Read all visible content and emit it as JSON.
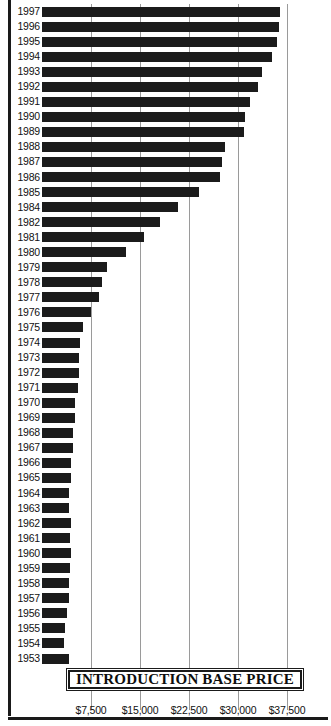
{
  "chart_data": {
    "type": "bar",
    "orientation": "horizontal",
    "title": "INTRODUCTION BASE PRICE",
    "xlabel": "",
    "ylabel": "",
    "xlim": [
      0,
      38700
    ],
    "grid": true,
    "gridlines_at": [
      7500,
      15000,
      22500,
      30000,
      37500
    ],
    "xtick_labels": [
      "$7,500",
      "$15,000",
      "$22,500",
      "$30,000",
      "$37,500"
    ],
    "xtick_values": [
      7500,
      15000,
      22500,
      30000,
      37500
    ],
    "legend": "none",
    "categories": [
      "1997",
      "1996",
      "1995",
      "1994",
      "1993",
      "1992",
      "1991",
      "1990",
      "1989",
      "1988",
      "1987",
      "1986",
      "1985",
      "1984",
      "1982",
      "1981",
      "1980",
      "1979",
      "1978",
      "1977",
      "1976",
      "1975",
      "1974",
      "1973",
      "1972",
      "1971",
      "1970",
      "1969",
      "1968",
      "1967",
      "1966",
      "1965",
      "1964",
      "1963",
      "1962",
      "1961",
      "1960",
      "1959",
      "1958",
      "1957",
      "1956",
      "1955",
      "1954",
      "1953"
    ],
    "values": [
      36500,
      36200,
      36000,
      35200,
      33700,
      33100,
      31900,
      31100,
      30900,
      28000,
      27600,
      27200,
      24000,
      20800,
      18000,
      15600,
      12800,
      9900,
      9200,
      8700,
      7500,
      6300,
      5800,
      5600,
      5700,
      5500,
      5100,
      5000,
      4800,
      4700,
      4500,
      4400,
      4100,
      4200,
      4400,
      4300,
      4400,
      4300,
      4200,
      4100,
      3900,
      3500,
      3400,
      4200
    ]
  },
  "axis": {
    "tick_label_0": "$7,500",
    "tick_label_1": "$15,000",
    "tick_label_2": "$22,500",
    "tick_label_3": "$30,000",
    "tick_label_4": "$37,500"
  },
  "title": {
    "text": "INTRODUCTION BASE PRICE"
  },
  "colors": {
    "bar": "#1b1b1b",
    "grid": "#9a9a9a",
    "frame": "#1a1a1a",
    "text": "#111111",
    "background": "#ffffff"
  }
}
